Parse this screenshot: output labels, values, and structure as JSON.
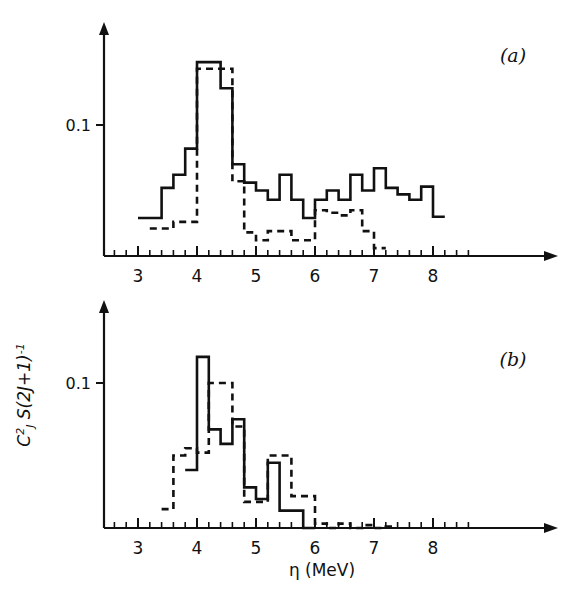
{
  "figure": {
    "background_color": "#ffffff",
    "ink_color": "#111111",
    "axis_title_x": "η (MeV)",
    "axis_title_y_parts": {
      "c": "C",
      "c_sup": "2",
      "c_sub": "J",
      "s": "S(2J+1)",
      "s_sup": "-1"
    },
    "axis_title_y_plain": "C²ⱼ S(2J+1)⁻¹"
  },
  "panels": [
    {
      "id": "a",
      "label": "(a)",
      "y_tick_labels": [
        "0.1"
      ],
      "y_tick_values": [
        0.1
      ],
      "x_tick_labels": [
        "3",
        "4",
        "5",
        "6",
        "7",
        "8"
      ],
      "x_tick_values": [
        3,
        4,
        5,
        6,
        7,
        8
      ]
    },
    {
      "id": "b",
      "label": "(b)",
      "y_tick_labels": [
        "0.1"
      ],
      "y_tick_values": [
        0.1
      ],
      "x_tick_labels": [
        "3",
        "4",
        "5",
        "6",
        "7",
        "8"
      ],
      "x_tick_values": [
        3,
        4,
        5,
        6,
        7,
        8
      ]
    }
  ],
  "chart_data": [
    {
      "type": "line",
      "panel": "a",
      "title": "(a)",
      "xlabel": "η (MeV)",
      "ylabel": "C²ⱼ S(2J+1)⁻¹",
      "xlim": [
        2.55,
        8.8
      ],
      "ylim": [
        0,
        0.175
      ],
      "grid": false,
      "legend": "none",
      "bin_width": 0.2,
      "series": [
        {
          "name": "solid",
          "style": "solid",
          "bin_starts": [
            3.0,
            3.2,
            3.4,
            3.6,
            3.8,
            4.0,
            4.2,
            4.4,
            4.6,
            4.8,
            5.0,
            5.2,
            5.4,
            5.6,
            5.8,
            6.0,
            6.2,
            6.4,
            6.6,
            6.8,
            7.0,
            7.2,
            7.4,
            7.6,
            7.8,
            8.0
          ],
          "values": [
            0.029,
            0.029,
            0.052,
            0.062,
            0.082,
            0.148,
            0.148,
            0.128,
            0.07,
            0.056,
            0.05,
            0.043,
            0.062,
            0.043,
            0.029,
            0.043,
            0.05,
            0.043,
            0.062,
            0.05,
            0.067,
            0.052,
            0.047,
            0.043,
            0.053,
            0.03
          ]
        },
        {
          "name": "dashed",
          "style": "dashed",
          "bin_starts": [
            3.2,
            3.4,
            3.6,
            3.8,
            4.0,
            4.2,
            4.4,
            4.6,
            4.8,
            5.0,
            5.2,
            5.4,
            5.6,
            5.8,
            6.0,
            6.2,
            6.4,
            6.6,
            6.8,
            7.0
          ],
          "values": [
            0.021,
            0.021,
            0.026,
            0.026,
            0.143,
            0.143,
            0.143,
            0.057,
            0.018,
            0.012,
            0.019,
            0.019,
            0.012,
            0.012,
            0.035,
            0.033,
            0.031,
            0.035,
            0.019,
            0.006
          ]
        }
      ]
    },
    {
      "type": "line",
      "panel": "b",
      "title": "(b)",
      "xlabel": "η (MeV)",
      "ylabel": "C²ⱼ S(2J+1)⁻¹",
      "xlim": [
        2.55,
        8.8
      ],
      "ylim": [
        0,
        0.175
      ],
      "grid": false,
      "legend": "none",
      "bin_width": 0.2,
      "series": [
        {
          "name": "solid",
          "style": "solid",
          "bin_starts": [
            3.8,
            4.0,
            4.2,
            4.4,
            4.6,
            4.8,
            5.0,
            5.2,
            5.4,
            5.6,
            5.8
          ],
          "values": [
            0.04,
            0.118,
            0.068,
            0.058,
            0.075,
            0.028,
            0.02,
            0.045,
            0.012,
            0.012,
            0.0
          ]
        },
        {
          "name": "dashed",
          "style": "dashed",
          "bin_starts": [
            3.4,
            3.6,
            3.8,
            4.0,
            4.2,
            4.4,
            4.6,
            4.8,
            5.0,
            5.2,
            5.4,
            5.6,
            5.8,
            6.0,
            6.4,
            6.8,
            7.2
          ],
          "values": [
            0.013,
            0.05,
            0.055,
            0.052,
            0.1,
            0.1,
            0.07,
            0.018,
            0.018,
            0.05,
            0.05,
            0.022,
            0.022,
            0.003,
            0.003,
            0.002,
            0.001
          ]
        }
      ]
    }
  ]
}
